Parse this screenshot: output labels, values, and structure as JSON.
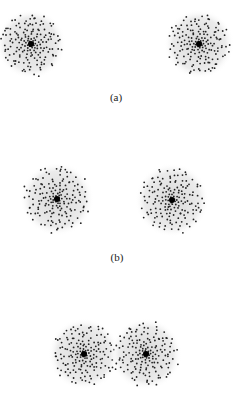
{
  "figure": {
    "panels": [
      {
        "label": "(a)",
        "label_x": 116,
        "label_y": 91,
        "clusters": [
          {
            "cx": 31,
            "cy": 44,
            "r": 32
          },
          {
            "cx": 199,
            "cy": 44,
            "r": 32
          }
        ]
      },
      {
        "label": "(b)",
        "label_x": 117,
        "label_y": 251,
        "clusters": [
          {
            "cx": 57,
            "cy": 199,
            "r": 34
          },
          {
            "cx": 172,
            "cy": 200,
            "r": 34
          }
        ]
      },
      {
        "label": "",
        "label_x": 117,
        "label_y": 400,
        "clusters": [
          {
            "cx": 84,
            "cy": 354,
            "r": 33
          },
          {
            "cx": 146,
            "cy": 354,
            "r": 33
          }
        ]
      }
    ],
    "colors": {
      "halo": "#e6e6e6",
      "dot": "#222222",
      "core": "#000000"
    }
  }
}
